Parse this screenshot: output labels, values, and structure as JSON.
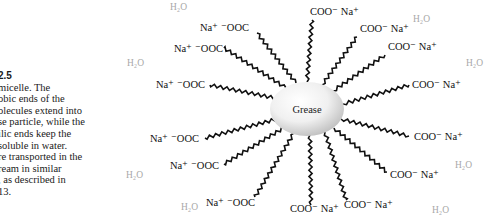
{
  "caption": {
    "figure_number": "2.5",
    "lines": [
      "micelle. The",
      "obic ends of the",
      "olecules extend into",
      "se particle, while the",
      "ilic ends keep the",
      "soluble in water.",
      "re transported in the",
      "ream in similar",
      ", as described in",
      " 13."
    ]
  },
  "diagram": {
    "core_label": "Grease",
    "colors": {
      "core_light": "#ffffff",
      "core_dark": "#c8c8c8",
      "tail": "#111111",
      "water": "#a8a8a8"
    },
    "left_labels": [
      {
        "text": "Na⁺ ⁻OOC",
        "x": 200,
        "y": 31
      },
      {
        "text": "Na⁺ ⁻OOC",
        "x": 174,
        "y": 52
      },
      {
        "text": "Na⁺ ⁻OOC",
        "x": 156,
        "y": 88
      },
      {
        "text": "Na⁺ ⁻OOC",
        "x": 150,
        "y": 142
      },
      {
        "text": "Na⁺ ⁻OOC",
        "x": 170,
        "y": 169
      },
      {
        "text": "Na⁺ ⁻OOC",
        "x": 206,
        "y": 206
      }
    ],
    "right_labels": [
      {
        "text": "COO⁻ Na⁺",
        "x": 310,
        "y": 15
      },
      {
        "text": "COO⁻ Na⁺",
        "x": 360,
        "y": 32
      },
      {
        "text": "COO⁻ Na⁺",
        "x": 388,
        "y": 50
      },
      {
        "text": "COO⁻ Na⁺",
        "x": 412,
        "y": 88
      },
      {
        "text": "COO⁻ Na⁺",
        "x": 414,
        "y": 140
      },
      {
        "text": "COO⁻ Na⁺",
        "x": 390,
        "y": 178
      },
      {
        "text": "COO⁻ Na⁺",
        "x": 344,
        "y": 208
      },
      {
        "text": "COO⁻ Na⁺",
        "x": 290,
        "y": 212
      }
    ],
    "water_labels": [
      {
        "text": "H₂O",
        "x": 170,
        "y": 10
      },
      {
        "text": "H₂O",
        "x": 413,
        "y": 22
      },
      {
        "text": "H₂O",
        "x": 127,
        "y": 66
      },
      {
        "text": "H₂O",
        "x": 466,
        "y": 66
      },
      {
        "text": "H₂O",
        "x": 455,
        "y": 168
      },
      {
        "text": "H₂O",
        "x": 126,
        "y": 178
      },
      {
        "text": "H₂O",
        "x": 181,
        "y": 210
      },
      {
        "text": "H₂O",
        "x": 432,
        "y": 213
      }
    ]
  }
}
